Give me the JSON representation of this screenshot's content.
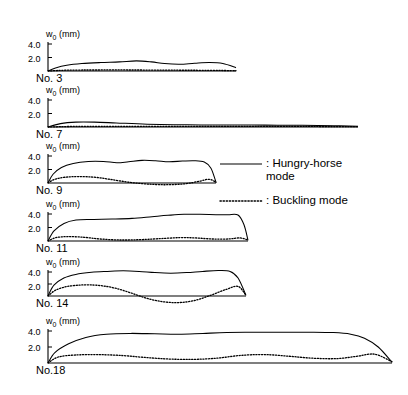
{
  "figure": {
    "y_axis_label": "w0 (mm)",
    "y_axis_label_main": "w",
    "y_axis_label_sub": "0",
    "y_axis_label_unit": " (mm)",
    "tick_labels": [
      "4.0",
      "2.0"
    ]
  },
  "legend": {
    "entries": [
      {
        "style": "solid",
        "label": ": Hungry-horse\n  mode"
      },
      {
        "style": "dotted",
        "label": ": Buckling mode"
      }
    ]
  },
  "panels": [
    {
      "name": "No. 3"
    },
    {
      "name": "No. 7"
    },
    {
      "name": "No. 9"
    },
    {
      "name": "No. 11"
    },
    {
      "name": "No. 14"
    },
    {
      "name": "No.18"
    }
  ],
  "chart_data": {
    "type": "line",
    "title": "",
    "xlabel": "",
    "ylabel": "w0 (mm)",
    "ylim": [
      -2.0,
      4.6
    ],
    "yticks": [
      2.0,
      4.0
    ],
    "grid": false,
    "legend_position": "right-middle",
    "panels": [
      {
        "name": "No. 3",
        "x_range": [
          0,
          100
        ],
        "series": [
          {
            "name": "Hungry-horse mode",
            "style": "solid",
            "x": [
              0,
              4,
              10,
              18,
              28,
              38,
              47,
              55,
              62,
              70,
              78,
              86,
              93,
              100
            ],
            "y": [
              0.0,
              0.45,
              0.85,
              1.1,
              1.25,
              1.35,
              1.5,
              1.35,
              1.1,
              1.0,
              1.15,
              1.25,
              1.1,
              0.5
            ]
          },
          {
            "name": "Buckling mode",
            "style": "dotted",
            "x": [
              0,
              10,
              25,
              45,
              65,
              85,
              100
            ],
            "y": [
              0.0,
              0.12,
              0.15,
              0.15,
              0.12,
              0.1,
              0.05
            ]
          }
        ]
      },
      {
        "name": "No. 7",
        "x_range": [
          0,
          100
        ],
        "series": [
          {
            "name": "Hungry-horse mode",
            "style": "solid",
            "x": [
              0,
              4,
              9,
              15,
              22,
              32,
              45,
              58,
              70,
              82,
              92,
              100
            ],
            "y": [
              0.0,
              0.5,
              0.72,
              0.72,
              0.6,
              0.42,
              0.32,
              0.3,
              0.28,
              0.25,
              0.2,
              0.12
            ]
          },
          {
            "name": "Buckling mode",
            "style": "dotted",
            "x": [
              0,
              10,
              25,
              45,
              65,
              85,
              100
            ],
            "y": [
              0.0,
              0.1,
              0.1,
              0.1,
              0.08,
              0.08,
              0.05
            ]
          }
        ]
      },
      {
        "name": "No. 9",
        "x_range": [
          0,
          100
        ],
        "series": [
          {
            "name": "Hungry-horse mode",
            "style": "solid",
            "x": [
              0,
              3,
              8,
              15,
              24,
              33,
              41,
              48,
              56,
              64,
              72,
              80,
              87,
              93,
              97,
              100
            ],
            "y": [
              0.0,
              1.3,
              2.3,
              2.9,
              3.2,
              3.2,
              3.0,
              3.15,
              3.35,
              3.3,
              3.15,
              3.25,
              3.3,
              3.1,
              2.2,
              0.1
            ]
          },
          {
            "name": "Buckling mode",
            "style": "dotted",
            "x": [
              0,
              4,
              10,
              18,
              28,
              38,
              50,
              62,
              72,
              82,
              90,
              96,
              100
            ],
            "y": [
              0.0,
              0.55,
              0.85,
              0.95,
              0.85,
              0.5,
              0.05,
              -0.2,
              -0.25,
              -0.1,
              0.25,
              0.55,
              0.1
            ]
          }
        ]
      },
      {
        "name": "No. 11",
        "x_range": [
          0,
          100
        ],
        "series": [
          {
            "name": "Hungry-horse mode",
            "style": "solid",
            "x": [
              0,
              3,
              8,
              14,
              22,
              32,
              42,
              52,
              60,
              68,
              76,
              84,
              90,
              95,
              98,
              100
            ],
            "y": [
              0.0,
              1.5,
              2.6,
              3.1,
              3.2,
              3.25,
              3.35,
              3.6,
              3.8,
              3.95,
              3.95,
              3.9,
              3.9,
              3.85,
              2.4,
              0.1
            ]
          },
          {
            "name": "Buckling mode",
            "style": "dotted",
            "x": [
              0,
              4,
              10,
              18,
              26,
              36,
              46,
              56,
              66,
              74,
              82,
              90,
              96,
              100
            ],
            "y": [
              0.0,
              0.5,
              0.65,
              0.55,
              0.3,
              0.15,
              0.2,
              0.35,
              0.5,
              0.45,
              0.3,
              0.3,
              0.45,
              0.15
            ]
          }
        ]
      },
      {
        "name": "No. 14",
        "x_range": [
          0,
          100
        ],
        "series": [
          {
            "name": "Hungry-horse mode",
            "style": "solid",
            "x": [
              0,
              3,
              8,
              14,
              22,
              30,
              38,
              46,
              54,
              62,
              70,
              78,
              86,
              92,
              96,
              100
            ],
            "y": [
              0.0,
              1.8,
              3.0,
              3.6,
              3.95,
              4.1,
              4.2,
              4.1,
              3.9,
              3.8,
              3.9,
              4.1,
              4.25,
              4.1,
              3.0,
              0.1
            ]
          },
          {
            "name": "Buckling mode",
            "style": "dotted",
            "x": [
              0,
              4,
              10,
              18,
              26,
              34,
              42,
              50,
              58,
              66,
              74,
              82,
              90,
              96,
              100
            ],
            "y": [
              0.0,
              1.0,
              1.6,
              1.85,
              1.75,
              1.3,
              0.5,
              -0.4,
              -0.95,
              -1.1,
              -0.75,
              0.1,
              1.1,
              1.6,
              0.1
            ]
          }
        ]
      },
      {
        "name": "No.18",
        "x_range": [
          0,
          100
        ],
        "series": [
          {
            "name": "Hungry-horse mode",
            "style": "solid",
            "x": [
              0,
              2,
              6,
              11,
              17,
              24,
              31,
              38,
              45,
              52,
              60,
              68,
              76,
              83,
              88,
              92,
              96,
              100
            ],
            "y": [
              0.0,
              1.3,
              2.4,
              3.2,
              3.6,
              3.7,
              3.65,
              3.6,
              3.7,
              3.8,
              3.85,
              3.85,
              3.85,
              3.8,
              3.6,
              3.1,
              2.0,
              0.1
            ]
          },
          {
            "name": "Buckling mode",
            "style": "dotted",
            "x": [
              0,
              3,
              8,
              14,
              21,
              28,
              35,
              42,
              49,
              56,
              63,
              70,
              77,
              84,
              90,
              95,
              100
            ],
            "y": [
              0.0,
              0.75,
              1.0,
              1.05,
              0.95,
              0.7,
              0.5,
              0.45,
              0.6,
              0.95,
              1.05,
              0.85,
              0.6,
              0.55,
              0.85,
              1.1,
              0.15
            ]
          }
        ]
      }
    ]
  }
}
